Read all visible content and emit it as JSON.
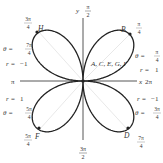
{
  "diagram": {
    "type": "polar-rose",
    "equation_implied": "r = sin 2θ",
    "origin_label": "A, C, E, G, I",
    "axes": {
      "x_label": "x",
      "x_right_angle": "2π",
      "x_left_angle": "π",
      "y_label": "y",
      "y_top_angle": "π/2",
      "y_bottom_angle": "3π/2"
    },
    "angle_labels": {
      "upper_right": {
        "num": "π",
        "den": "4"
      },
      "upper_left": {
        "num": "3π",
        "den": "4"
      },
      "lower_left": {
        "num": "5π",
        "den": "4"
      },
      "lower_right": {
        "num": "7π",
        "den": "4"
      }
    },
    "points": [
      {
        "name": "B",
        "theta_num": "π",
        "theta_den": "4",
        "r": "1",
        "position": "upper-right"
      },
      {
        "name": "D",
        "theta_num": "3π",
        "theta_den": "4",
        "r": "−1",
        "position": "lower-right"
      },
      {
        "name": "F",
        "theta_num": "5π",
        "theta_den": "4",
        "r": "1",
        "position": "lower-left"
      },
      {
        "name": "H",
        "theta_num": "7π",
        "theta_den": "4",
        "r": "−1",
        "position": "upper-left"
      }
    ],
    "annotations": {
      "theta_prefix": "θ =",
      "r_prefix": "r ="
    },
    "colors": {
      "curve": "#222222",
      "axis": "#444444",
      "guide": "#cccccc",
      "text": "#333333"
    }
  }
}
